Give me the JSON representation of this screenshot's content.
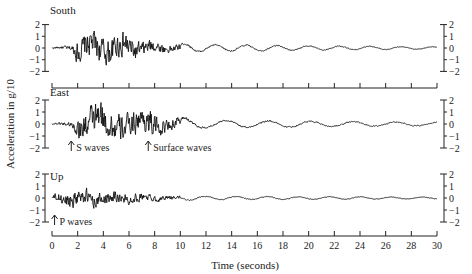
{
  "chart_data": {
    "type": "line",
    "title": "",
    "xlabel": "Time (seconds)",
    "ylabel": "Acceleration in g/10",
    "xlim": [
      0,
      30
    ],
    "x_ticks": [
      0,
      2,
      4,
      6,
      8,
      10,
      12,
      14,
      16,
      18,
      20,
      22,
      24,
      26,
      28,
      30
    ],
    "y_ticks": [
      2,
      1,
      0,
      -1,
      -2
    ],
    "ylim": [
      -2,
      2
    ],
    "grid": false,
    "legend": "none",
    "series": [
      {
        "name": "South",
        "description": "Strong-motion accelerogram, south component; large oscillations roughly 1.5–7 s, peaks near ±1.8, decaying after ~9 s to small amplitude (~±0.2) through 30 s",
        "envelope": [
          {
            "t": 0,
            "amp": 0.1
          },
          {
            "t": 1.5,
            "amp": 0.3
          },
          {
            "t": 2,
            "amp": 1.4
          },
          {
            "t": 3,
            "amp": 1.8
          },
          {
            "t": 5,
            "amp": 1.6
          },
          {
            "t": 6,
            "amp": 1.6
          },
          {
            "t": 7,
            "amp": 1.0
          },
          {
            "t": 9,
            "amp": 0.5
          },
          {
            "t": 12,
            "amp": 0.3
          },
          {
            "t": 20,
            "amp": 0.2
          },
          {
            "t": 30,
            "amp": 0.1
          }
        ]
      },
      {
        "name": "East",
        "description": "East component; S-wave arrival near 1.5 s, peaks near ±2 between 2–6 s, second burst near 7.5 s (surface waves), slow long-period decay afterwards",
        "envelope": [
          {
            "t": 0,
            "amp": 0.1
          },
          {
            "t": 1.5,
            "amp": 0.3
          },
          {
            "t": 2,
            "amp": 1.3
          },
          {
            "t": 3,
            "amp": 2.0
          },
          {
            "t": 5,
            "amp": 1.9
          },
          {
            "t": 6,
            "amp": 1.3
          },
          {
            "t": 7.5,
            "amp": 1.8
          },
          {
            "t": 9,
            "amp": 0.7
          },
          {
            "t": 12,
            "amp": 0.35
          },
          {
            "t": 20,
            "amp": 0.25
          },
          {
            "t": 30,
            "amp": 0.15
          }
        ]
      },
      {
        "name": "Up",
        "description": "Vertical component; P-wave arrival near 0.3 s, high-frequency motion peaking ~±1 around 1–4 s, decaying to small amplitude after ~9 s",
        "envelope": [
          {
            "t": 0,
            "amp": 0.1
          },
          {
            "t": 0.3,
            "amp": 0.6
          },
          {
            "t": 1.5,
            "amp": 1.1
          },
          {
            "t": 4,
            "amp": 0.8
          },
          {
            "t": 7,
            "amp": 0.5
          },
          {
            "t": 9,
            "amp": 0.25
          },
          {
            "t": 12,
            "amp": 0.15
          },
          {
            "t": 30,
            "amp": 0.08
          }
        ]
      }
    ],
    "annotations": [
      {
        "panel": "East",
        "text": "S waves",
        "t": 1.5,
        "arrow": "up"
      },
      {
        "panel": "East",
        "text": "Surface waves",
        "t": 7.5,
        "arrow": "up"
      },
      {
        "panel": "Up",
        "text": "P waves",
        "t": 0.2,
        "arrow": "up"
      }
    ]
  },
  "panels": [
    {
      "title": "South"
    },
    {
      "title": "East"
    },
    {
      "title": "Up"
    }
  ],
  "axis": {
    "ylabel": "Acceleration in g/10",
    "xlabel": "Time (seconds)"
  }
}
